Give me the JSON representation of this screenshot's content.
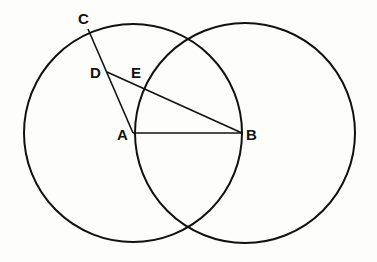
{
  "diagram": {
    "type": "geometric-construction",
    "circles": [
      {
        "name": "circle-a",
        "center": "A",
        "cx": 133,
        "cy": 133,
        "r": 109
      },
      {
        "name": "circle-b",
        "center": "B",
        "cx": 242,
        "cy": 133,
        "r": 110
      }
    ],
    "points": {
      "A": {
        "label": "A",
        "x": 133,
        "y": 133
      },
      "B": {
        "label": "B",
        "x": 242,
        "y": 133
      },
      "C": {
        "label": "C",
        "x": 88,
        "y": 29
      },
      "D": {
        "label": "D",
        "x": 107,
        "y": 72
      },
      "E": {
        "label": "E",
        "x": 141,
        "y": 88
      }
    },
    "segments": [
      [
        "A",
        "B"
      ],
      [
        "C",
        "A"
      ],
      [
        "D",
        "B"
      ]
    ],
    "colors": {
      "ink": "#111111",
      "paper": "#fdfdfb"
    }
  }
}
